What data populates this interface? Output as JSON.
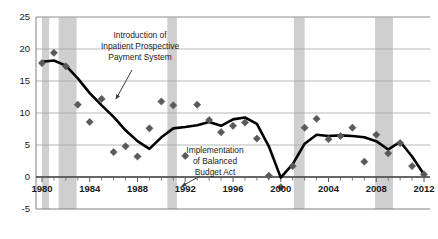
{
  "chart_data": {
    "type": "scatter",
    "title": "",
    "subtitle": "",
    "xlabel": "",
    "ylabel": "",
    "xlim": [
      1979.5,
      2012.5
    ],
    "ylim": [
      -5,
      25
    ],
    "grid": true,
    "legend_position": "none",
    "y_ticks": [
      -5,
      0,
      5,
      10,
      15,
      20,
      25
    ],
    "y_tick_labels": [
      "-5",
      "0",
      "5",
      "10",
      "15",
      "20",
      "25"
    ],
    "x_ticks": [
      1980,
      1984,
      1988,
      1992,
      1996,
      2000,
      2004,
      2008,
      2012
    ],
    "x_tick_labels": [
      "1980",
      "1984",
      "1988",
      "1992",
      "1996",
      "2000",
      "2004",
      "2008",
      "2012"
    ],
    "x_minor_tick_step": 1,
    "marker_color": "#595959",
    "line_color": "#000000",
    "recession_band_color": "#bfbfbf",
    "gridline_color": "#a6a6a6",
    "series": [
      {
        "name": "Annual values",
        "style": "scatter",
        "x": [
          1980,
          1981,
          1982,
          1983,
          1984,
          1985,
          1986,
          1987,
          1988,
          1989,
          1990,
          1991,
          1992,
          1993,
          1994,
          1995,
          1996,
          1997,
          1998,
          1999,
          2000,
          2001,
          2002,
          2003,
          2004,
          2005,
          2006,
          2007,
          2008,
          2009,
          2010,
          2011,
          2012
        ],
        "y": [
          17.8,
          19.4,
          17.3,
          11.3,
          8.6,
          12.2,
          3.9,
          4.8,
          3.2,
          7.6,
          11.8,
          11.2,
          3.3,
          11.3,
          8.9,
          7.0,
          8.0,
          8.5,
          6.0,
          0.2,
          -1.6,
          1.7,
          7.7,
          9.1,
          5.9,
          6.4,
          7.7,
          2.4,
          6.6,
          3.7,
          5.3,
          1.7,
          0.4
        ]
      },
      {
        "name": "Trend line",
        "style": "line",
        "x": [
          1980,
          1981,
          1982,
          1983,
          1984,
          1985,
          1986,
          1987,
          1988,
          1989,
          1990,
          1991,
          1992,
          1993,
          1994,
          1995,
          1996,
          1997,
          1998,
          1999,
          2000,
          2001,
          2002,
          2003,
          2004,
          2005,
          2006,
          2007,
          2008,
          2009,
          2010,
          2011,
          2012
        ],
        "y": [
          18.0,
          18.2,
          17.4,
          15.4,
          13.1,
          11.2,
          9.4,
          7.3,
          5.6,
          4.4,
          6.2,
          7.6,
          7.8,
          8.1,
          8.6,
          8.0,
          9.0,
          9.3,
          8.3,
          4.8,
          -0.1,
          2.0,
          5.2,
          6.6,
          6.4,
          6.5,
          6.4,
          6.2,
          5.6,
          4.3,
          5.5,
          3.2,
          0.4
        ]
      }
    ],
    "recession_bands": [
      {
        "start": 1980.0,
        "end": 1980.6
      },
      {
        "start": 1981.4,
        "end": 1982.9
      },
      {
        "start": 1990.5,
        "end": 1991.3
      },
      {
        "start": 2001.1,
        "end": 2002.0
      },
      {
        "start": 2007.9,
        "end": 2009.4
      }
    ],
    "annotations": [
      {
        "name": "ipps-annotation",
        "lines": [
          "Introduction of",
          "Inpatient Prospective",
          "Payment System"
        ],
        "text": "Introduction of Inpatient Prospective Payment System",
        "text_x": 140,
        "text_y": 38,
        "arrow_from": [
          132,
          70
        ],
        "arrow_to": [
          116,
          99
        ]
      },
      {
        "name": "bba-annotation",
        "lines": [
          "Implementation",
          "of Balanced",
          "Budget Act"
        ],
        "text": "Implementation of Balanced Budget Act",
        "text_x": 215,
        "text_y": 153,
        "arrow_from": [
          200,
          176
        ],
        "arrow_to": [
          182,
          186
        ]
      }
    ]
  }
}
